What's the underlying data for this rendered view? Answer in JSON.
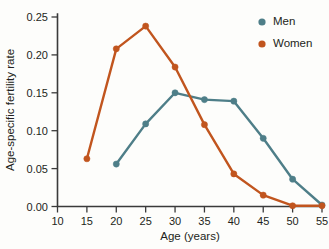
{
  "chart_data": {
    "type": "line",
    "title": "",
    "xlabel": "Age (years)",
    "ylabel": "Age-specific fertility rate",
    "xlim": [
      10,
      55
    ],
    "ylim": [
      0.0,
      0.25
    ],
    "grid": false,
    "legend_position": "top-right",
    "xticks": [
      10,
      15,
      20,
      25,
      30,
      35,
      40,
      45,
      50,
      55
    ],
    "xtick_labels": [
      "10",
      "15",
      "20",
      "25",
      "30",
      "35",
      "40",
      "45",
      "50",
      "55"
    ],
    "yticks": [
      0.0,
      0.05,
      0.1,
      0.15,
      0.2,
      0.25
    ],
    "ytick_labels": [
      "0.00",
      "0.05",
      "0.10",
      "0.15",
      "0.20",
      "0.25"
    ],
    "x": [
      15,
      20,
      25,
      30,
      35,
      40,
      45,
      50,
      55
    ],
    "series": [
      {
        "name": "Men",
        "color": "#4e7e88",
        "x": [
          20,
          25,
          30,
          35,
          40,
          45,
          50,
          55
        ],
        "values": [
          0.056,
          0.109,
          0.15,
          0.141,
          0.139,
          0.09,
          0.036,
          0.002
        ]
      },
      {
        "name": "Women",
        "color": "#c1551e",
        "x": [
          15,
          20,
          25,
          30,
          35,
          40,
          45,
          50,
          55
        ],
        "values": [
          0.063,
          0.208,
          0.238,
          0.184,
          0.108,
          0.043,
          0.015,
          0.001,
          0.001
        ]
      }
    ]
  },
  "legend": {
    "entries": [
      {
        "label": "Men",
        "color": "#4e7e88"
      },
      {
        "label": "Women",
        "color": "#c1551e"
      }
    ]
  },
  "colors": {
    "men": "#4e7e88",
    "women": "#c1551e",
    "axis": "#3a3a3a",
    "background": "#fdfdfb"
  }
}
